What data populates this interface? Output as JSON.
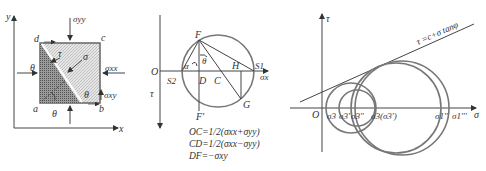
{
  "panel_a": {
    "axis_x": "x",
    "axis_y": "y",
    "corners": {
      "a": "a",
      "b": "b",
      "c": "c",
      "d": "d"
    },
    "stress_top": "σyy",
    "stress_right": "σxx",
    "stress_shear": "σxy",
    "angle_left": "θ",
    "angle_bottom": "θ",
    "angle_plane": "θ",
    "normal_stress": "σ",
    "shear_stress": "τ"
  },
  "panel_b": {
    "origin": "O",
    "sigma_axis": "σx",
    "tau_axis": "τ",
    "points": {
      "F": "F",
      "F_prime": "F'",
      "G": "G",
      "H": "H",
      "C": "C",
      "D": "D",
      "S1": "S1",
      "S2": "S2"
    },
    "angle_alpha": "α",
    "angle_theta": "θ",
    "equations": [
      "OC=1/2(σxx+σyy)",
      "CD=1/2(σxx−σyy)",
      "DF=−σxy"
    ]
  },
  "panel_c": {
    "origin": "O",
    "sigma_axis": "σ",
    "tau_axis": "τ",
    "envelope_label": "τ =c+σ tanφ",
    "tick_labels": [
      "σ3",
      "σ3'",
      "σ3''",
      "σ3(σ3')",
      "σ1''",
      "σ1'''"
    ]
  }
}
